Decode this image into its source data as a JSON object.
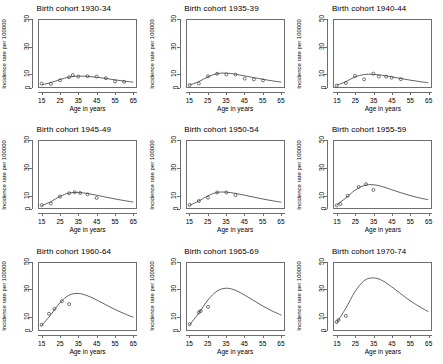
{
  "figure": {
    "layout": "3x3 grid of small-multiple line charts",
    "xlabel": "Age in years",
    "ylabel": "Incidence rate per 100000",
    "xticks": [
      15,
      25,
      35,
      45,
      55,
      65
    ],
    "yticks": [
      0,
      10,
      30,
      50
    ],
    "xlim": [
      13,
      67
    ],
    "ylim": [
      0,
      50
    ]
  },
  "chart_data": [
    {
      "type": "line",
      "title": "Birth cohort 1930-34",
      "xlabel": "Age in years",
      "ylabel": "Incidence rate per 100000",
      "xlim": [
        13,
        67
      ],
      "ylim": [
        0,
        50
      ],
      "xticks": [
        15,
        25,
        35,
        45,
        55,
        65
      ],
      "yticks": [
        0,
        10,
        30,
        50
      ],
      "grid": false,
      "legend": "none",
      "series": [
        {
          "name": "observed",
          "marker": "open-circle",
          "x": [
            15,
            20,
            25,
            30,
            32,
            35,
            40,
            45,
            50,
            55,
            60
          ],
          "y": [
            3.2,
            3.0,
            5.6,
            7.8,
            9.4,
            8.3,
            8.6,
            8.3,
            7.1,
            4.8,
            4.5
          ]
        },
        {
          "name": "fitted",
          "marker": "none",
          "x": [
            15,
            20,
            25,
            30,
            35,
            40,
            45,
            50,
            55,
            60,
            65
          ],
          "y": [
            2.3,
            3.9,
            6.1,
            7.9,
            8.6,
            8.4,
            7.8,
            6.9,
            5.9,
            5.0,
            4.2
          ]
        }
      ]
    },
    {
      "type": "line",
      "title": "Birth cohort 1935-39",
      "xlabel": "Age in years",
      "ylabel": "Incidence rate per 100000",
      "xlim": [
        13,
        67
      ],
      "ylim": [
        0,
        50
      ],
      "xticks": [
        15,
        25,
        35,
        45,
        55,
        65
      ],
      "yticks": [
        0,
        10,
        30,
        50
      ],
      "grid": false,
      "legend": "none",
      "series": [
        {
          "name": "observed",
          "marker": "open-circle",
          "x": [
            15,
            20,
            25,
            30,
            35,
            40,
            45,
            50,
            55
          ],
          "y": [
            2.2,
            3.3,
            8.5,
            10.3,
            9.8,
            9.7,
            6.8,
            6.2,
            5.5
          ]
        },
        {
          "name": "fitted",
          "marker": "none",
          "x": [
            15,
            20,
            25,
            30,
            35,
            40,
            45,
            50,
            55,
            60,
            65
          ],
          "y": [
            2.2,
            4.6,
            8.1,
            10.4,
            10.8,
            10.0,
            8.8,
            7.5,
            6.3,
            5.2,
            4.3
          ]
        }
      ]
    },
    {
      "type": "line",
      "title": "Birth cohort 1940-44",
      "xlabel": "Age in years",
      "ylabel": "Incidence rate per 100000",
      "xlim": [
        13,
        67
      ],
      "ylim": [
        0,
        50
      ],
      "xticks": [
        15,
        25,
        35,
        45,
        55,
        65
      ],
      "yticks": [
        0,
        10,
        30,
        50
      ],
      "grid": false,
      "legend": "none",
      "series": [
        {
          "name": "observed",
          "marker": "open-circle",
          "x": [
            15,
            20,
            25,
            30,
            35,
            38,
            42,
            45,
            50
          ],
          "y": [
            1.8,
            3.6,
            8.8,
            6.3,
            10.4,
            8.3,
            8.2,
            7.5,
            6.4
          ]
        },
        {
          "name": "fitted",
          "marker": "none",
          "x": [
            15,
            20,
            25,
            30,
            35,
            40,
            45,
            50,
            55,
            60,
            65
          ],
          "y": [
            2.0,
            4.6,
            8.0,
            9.8,
            9.9,
            9.2,
            8.1,
            6.9,
            5.7,
            4.7,
            3.8
          ]
        }
      ]
    },
    {
      "type": "line",
      "title": "Birth cohort 1945-49",
      "xlabel": "Age in years",
      "ylabel": "Incidence rate per 100000",
      "xlim": [
        13,
        67
      ],
      "ylim": [
        0,
        50
      ],
      "xticks": [
        15,
        25,
        35,
        45,
        55,
        65
      ],
      "yticks": [
        0,
        10,
        30,
        50
      ],
      "grid": false,
      "legend": "none",
      "series": [
        {
          "name": "observed",
          "marker": "open-circle",
          "x": [
            15,
            20,
            25,
            30,
            33,
            36,
            40,
            45
          ],
          "y": [
            2.8,
            4.0,
            9.0,
            11.4,
            12.2,
            11.6,
            10.6,
            8.0
          ]
        },
        {
          "name": "fitted",
          "marker": "none",
          "x": [
            15,
            20,
            25,
            30,
            35,
            40,
            45,
            50,
            55,
            60,
            65
          ],
          "y": [
            2.4,
            5.3,
            9.2,
            11.6,
            12.0,
            11.2,
            10.0,
            8.6,
            7.3,
            6.1,
            5.0
          ]
        }
      ]
    },
    {
      "type": "line",
      "title": "Birth cohort 1950-54",
      "xlabel": "Age in years",
      "ylabel": "Incidence rate per 100000",
      "xlim": [
        13,
        67
      ],
      "ylim": [
        0,
        50
      ],
      "xticks": [
        15,
        25,
        35,
        45,
        55,
        65
      ],
      "yticks": [
        0,
        10,
        30,
        50
      ],
      "grid": false,
      "legend": "none",
      "series": [
        {
          "name": "observed",
          "marker": "open-circle",
          "x": [
            15,
            20,
            25,
            30,
            35,
            40
          ],
          "y": [
            3.0,
            5.8,
            8.2,
            12.0,
            12.0,
            10.0
          ]
        },
        {
          "name": "fitted",
          "marker": "none",
          "x": [
            15,
            20,
            25,
            30,
            35,
            40,
            45,
            50,
            55,
            60,
            65
          ],
          "y": [
            2.7,
            5.8,
            9.6,
            12.0,
            12.2,
            11.3,
            10.0,
            8.6,
            7.2,
            6.0,
            4.9
          ]
        }
      ]
    },
    {
      "type": "line",
      "title": "Birth cohort 1955-59",
      "xlabel": "Age in years",
      "ylabel": "Incidence rate per 100000",
      "xlim": [
        13,
        67
      ],
      "ylim": [
        0,
        50
      ],
      "xticks": [
        15,
        25,
        35,
        45,
        55,
        65
      ],
      "yticks": [
        0,
        10,
        30,
        50
      ],
      "grid": false,
      "legend": "none",
      "series": [
        {
          "name": "observed",
          "marker": "open-circle",
          "x": [
            15,
            17,
            21,
            27,
            31,
            35
          ],
          "y": [
            2.6,
            3.6,
            9.6,
            16.0,
            18.0,
            13.8
          ]
        },
        {
          "name": "fitted",
          "marker": "none",
          "x": [
            15,
            20,
            25,
            30,
            35,
            40,
            45,
            50,
            55,
            60,
            65
          ],
          "y": [
            3.0,
            8.0,
            13.6,
            17.0,
            17.6,
            16.2,
            14.0,
            11.8,
            9.8,
            8.1,
            6.7
          ]
        }
      ]
    },
    {
      "type": "line",
      "title": "Birth cohort 1960-64",
      "xlabel": "Age in years",
      "ylabel": "Incidence rate per 100000",
      "xlim": [
        13,
        67
      ],
      "ylim": [
        0,
        50
      ],
      "xticks": [
        15,
        25,
        35,
        45,
        55,
        65
      ],
      "yticks": [
        0,
        10,
        30,
        50
      ],
      "grid": false,
      "legend": "none",
      "series": [
        {
          "name": "observed",
          "marker": "open-circle",
          "x": [
            15,
            19,
            22,
            26,
            30
          ],
          "y": [
            4.5,
            12.5,
            16.0,
            21.5,
            19.5
          ]
        },
        {
          "name": "fitted",
          "marker": "none",
          "x": [
            15,
            20,
            25,
            30,
            35,
            40,
            45,
            50,
            55,
            60,
            65
          ],
          "y": [
            4.0,
            11.8,
            20.5,
            26.0,
            27.2,
            25.5,
            22.5,
            19.0,
            15.6,
            12.6,
            10.0
          ]
        }
      ]
    },
    {
      "type": "line",
      "title": "Birth cohort 1965-69",
      "xlabel": "Age in years",
      "ylabel": "Incidence rate per 100000",
      "xlim": [
        13,
        67
      ],
      "ylim": [
        0,
        50
      ],
      "xticks": [
        15,
        25,
        35,
        45,
        55,
        65
      ],
      "yticks": [
        0,
        10,
        30,
        50
      ],
      "grid": false,
      "legend": "none",
      "series": [
        {
          "name": "observed",
          "marker": "open-circle",
          "x": [
            15,
            20,
            21,
            25
          ],
          "y": [
            5.0,
            13.5,
            14.5,
            17.5
          ]
        },
        {
          "name": "fitted",
          "marker": "none",
          "x": [
            15,
            20,
            25,
            30,
            35,
            40,
            45,
            50,
            55,
            60,
            65
          ],
          "y": [
            4.5,
            13.0,
            22.5,
            29.0,
            31.0,
            29.5,
            26.0,
            22.0,
            18.0,
            14.5,
            11.5
          ]
        }
      ]
    },
    {
      "type": "line",
      "title": "Birth cohort 1970-74",
      "xlabel": "Age in years",
      "ylabel": "Incidence rate per 100000",
      "xlim": [
        13,
        67
      ],
      "ylim": [
        0,
        50
      ],
      "xticks": [
        15,
        25,
        35,
        45,
        55,
        65
      ],
      "yticks": [
        0,
        10,
        30,
        50
      ],
      "grid": false,
      "legend": "none",
      "series": [
        {
          "name": "observed",
          "marker": "open-circle",
          "x": [
            15,
            16,
            20
          ],
          "y": [
            6.5,
            8.0,
            11.0
          ]
        },
        {
          "name": "fitted",
          "marker": "none",
          "x": [
            15,
            20,
            25,
            30,
            35,
            40,
            45,
            50,
            55,
            60,
            65
          ],
          "y": [
            6.0,
            16.5,
            28.5,
            36.5,
            38.5,
            36.5,
            32.0,
            27.0,
            22.0,
            17.8,
            14.0
          ]
        }
      ]
    }
  ]
}
